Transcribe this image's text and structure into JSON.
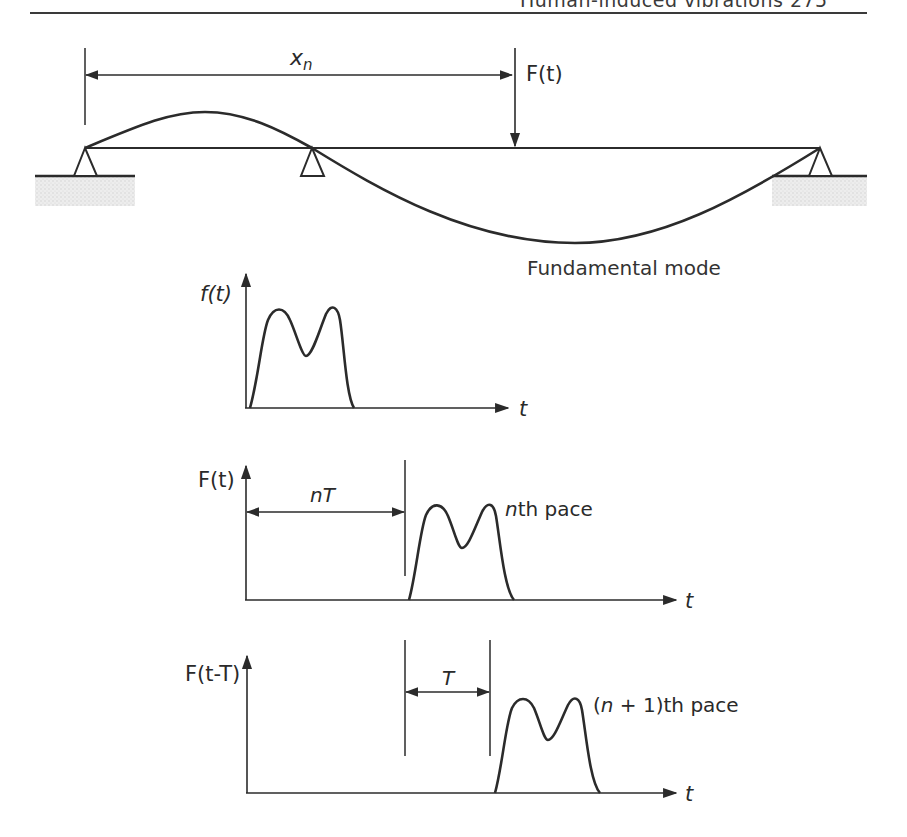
{
  "page": {
    "running_header": "Human-induced vibrations 275"
  },
  "beam_diagram": {
    "distance_label_base": "x",
    "distance_label_sub": "n",
    "force_label": "F(t)",
    "mode_label": "Fundamental mode",
    "supports": [
      "left-pin",
      "middle-pin",
      "right-pin"
    ]
  },
  "graphs": [
    {
      "y_label": "f(t)",
      "x_label": "t",
      "pulse_label": ""
    },
    {
      "y_label": "F(t)",
      "x_label": "t",
      "offset_label": "nT",
      "pulse_label_italic": "n",
      "pulse_label_rest": "th pace"
    },
    {
      "y_label_italic_1": "F(t-T",
      "y_label": "F(t-T)",
      "x_label": "t",
      "offset_label": "T",
      "pulse_label_prefix": "(",
      "pulse_label_italic": "n",
      "pulse_label_rest": " + 1)th pace"
    }
  ],
  "colors": {
    "line": "#2b2b2b",
    "ground_hatch": "#d9d9d9",
    "background": "#ffffff"
  }
}
